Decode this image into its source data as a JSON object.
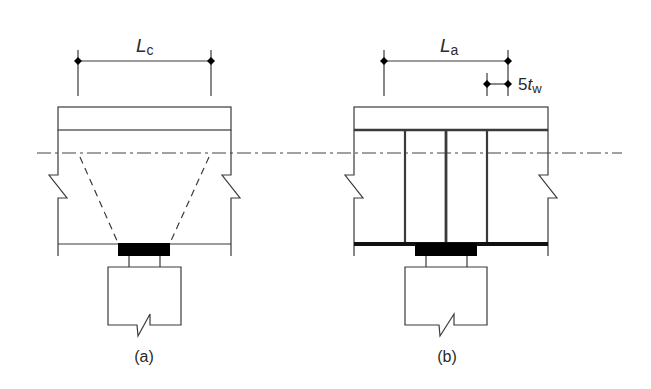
{
  "figure": {
    "colors": {
      "line": "#3a3a3a",
      "fill": "#000000",
      "background": "#ffffff"
    },
    "panels": [
      {
        "id": "a",
        "caption": "(a)",
        "dimension": {
          "symbol": "L",
          "subscript": "c"
        },
        "description": "Unstiffened web with dispersion lines from bearing plate"
      },
      {
        "id": "b",
        "caption": "(b)",
        "dimension": {
          "symbol": "L",
          "subscript": "a"
        },
        "secondary_dimension": {
          "prefix": "5",
          "symbol": "t",
          "subscript": "w"
        },
        "description": "Stiffened web with three vertical stiffeners over bearing"
      }
    ]
  }
}
